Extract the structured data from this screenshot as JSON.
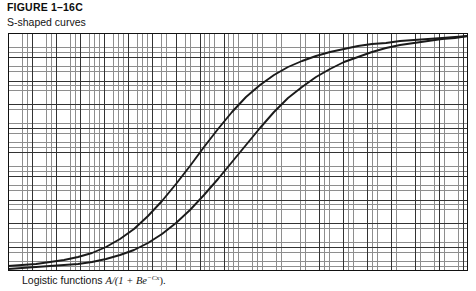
{
  "figure": {
    "number": "FIGURE 1–16C",
    "subtitle": "S-shaped curves",
    "caption_prefix": "Logistic functions ",
    "caption_formula_main": "A/(1 + Be",
    "caption_formula_exponent": "−Cx",
    "caption_formula_tail": ").",
    "caption_full": "Logistic functions A/(1 + Be−Cx)."
  },
  "colors": {
    "background": "#ffffff",
    "minor_grid": "#8e8e8e",
    "major_grid": "#333333",
    "border": "#111111",
    "curve": "#1a1a1a",
    "text": "#111111"
  },
  "chart_data": {
    "type": "line",
    "title": "S-shaped curves",
    "xlabel": "",
    "ylabel": "",
    "xlim": [
      0,
      460
    ],
    "ylim": [
      0,
      238
    ],
    "grid": true,
    "grid_minor_spacing_px": 4.79,
    "grid_major_spacing_px": 23.96,
    "legend": "none",
    "annotation": "Logistic functions A/(1 + Be^(-Cx)).",
    "series": [
      {
        "name": "logistic-curve-left",
        "formula": "A/(1 + Be^(-Cx))",
        "points": [
          [
            0,
            233
          ],
          [
            14,
            232
          ],
          [
            28,
            231
          ],
          [
            42,
            229
          ],
          [
            56,
            227
          ],
          [
            70,
            224
          ],
          [
            84,
            220
          ],
          [
            98,
            214
          ],
          [
            112,
            206
          ],
          [
            126,
            196
          ],
          [
            140,
            183
          ],
          [
            154,
            168
          ],
          [
            168,
            151
          ],
          [
            182,
            133
          ],
          [
            196,
            114
          ],
          [
            210,
            96
          ],
          [
            224,
            79
          ],
          [
            238,
            64
          ],
          [
            252,
            52
          ],
          [
            266,
            42
          ],
          [
            280,
            34
          ],
          [
            294,
            28
          ],
          [
            308,
            23
          ],
          [
            322,
            19
          ],
          [
            336,
            16
          ],
          [
            350,
            13
          ],
          [
            364,
            11
          ],
          [
            378,
            10
          ],
          [
            392,
            8
          ],
          [
            406,
            7
          ],
          [
            420,
            6
          ],
          [
            434,
            5
          ],
          [
            447,
            4
          ],
          [
            460,
            3
          ]
        ]
      },
      {
        "name": "logistic-curve-right",
        "formula": "A/(1 + Be^(-Cx)) shifted",
        "points": [
          [
            0,
            236
          ],
          [
            14,
            235
          ],
          [
            28,
            234
          ],
          [
            42,
            233
          ],
          [
            56,
            232
          ],
          [
            70,
            231
          ],
          [
            84,
            229
          ],
          [
            98,
            226
          ],
          [
            112,
            222
          ],
          [
            126,
            217
          ],
          [
            140,
            210
          ],
          [
            154,
            201
          ],
          [
            168,
            190
          ],
          [
            182,
            177
          ],
          [
            196,
            162
          ],
          [
            210,
            146
          ],
          [
            224,
            129
          ],
          [
            238,
            112
          ],
          [
            252,
            95
          ],
          [
            266,
            79
          ],
          [
            280,
            65
          ],
          [
            294,
            54
          ],
          [
            308,
            44
          ],
          [
            322,
            36
          ],
          [
            336,
            29
          ],
          [
            350,
            24
          ],
          [
            364,
            19
          ],
          [
            378,
            15
          ],
          [
            392,
            12
          ],
          [
            406,
            10
          ],
          [
            420,
            8
          ],
          [
            434,
            6
          ],
          [
            447,
            5
          ],
          [
            460,
            3
          ]
        ]
      }
    ]
  }
}
